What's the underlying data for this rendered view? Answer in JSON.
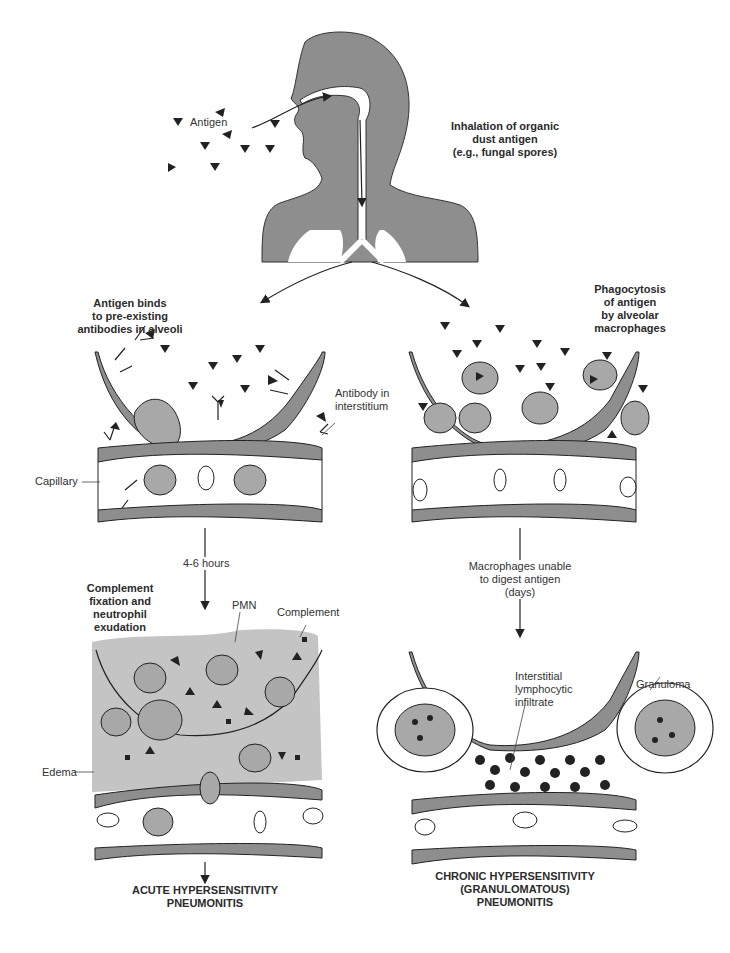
{
  "colors": {
    "tissue_gray": "#8e8e8e",
    "cell_gray": "#a8a8a8",
    "edema_gray": "#c4c4c4",
    "outline": "#222222",
    "background": "#ffffff"
  },
  "labels": {
    "antigen": "Antigen",
    "inhalation": [
      "Inhalation of organic",
      "dust antigen",
      "(e.g., fungal spores)"
    ],
    "left_step": [
      "Antigen binds",
      "to pre-existing",
      "antibodies in alveoli"
    ],
    "antibody_interstitium": [
      "Antibody in",
      "interstitium"
    ],
    "capillary": "Capillary",
    "right_step": [
      "Phagocytosis",
      "of antigen",
      "by alveolar",
      "macrophages"
    ],
    "left_time": "4-6 hours",
    "right_time": [
      "Macrophages unable",
      "to digest antigen",
      "(days)"
    ],
    "complement_step": [
      "Complement",
      "fixation and",
      "neutrophil",
      "exudation"
    ],
    "pmn": "PMN",
    "complement": "Complement",
    "edema": "Edema",
    "interstitial": [
      "Interstitial",
      "lymphocytic",
      "infiltrate"
    ],
    "granuloma": "Granuloma",
    "acute_outcome": [
      "ACUTE HYPERSENSITIVITY",
      "PNEUMONITIS"
    ],
    "chronic_outcome": [
      "CHRONIC HYPERSENSITIVITY",
      "(GRANULOMATOUS)",
      "PNEUMONITIS"
    ]
  }
}
